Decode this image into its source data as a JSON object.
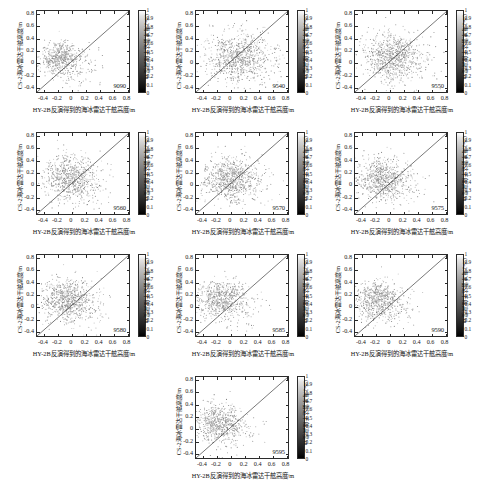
{
  "figure": {
    "axis_labels": {
      "xlabel": "HY-2B反演得到的海冰雷达干舷高度/m",
      "ylabel": "CS-2海冰雷达干舷高度/m",
      "colorbar_label": "CS-2海冰雷达干舷高度/m"
    },
    "xticks": [
      "-0.4",
      "-0.2",
      "0",
      "0.2",
      "0.4",
      "0.6",
      "0.8"
    ],
    "yticks": [
      "0.8",
      "0.6",
      "0.4",
      "0.2",
      "0",
      "-0.2",
      "-0.4"
    ],
    "colorbar_ticks": [
      "1",
      "0.9",
      "0.8",
      "0.7",
      "0.6",
      "0.5",
      "0.4",
      "0.3",
      "0.2",
      "0.1",
      "0"
    ],
    "colormap": "grayscale",
    "marker_color": "#9a9a9a",
    "line_color": "#1a1a1a"
  },
  "chart_data": [
    {
      "type": "scatter",
      "title": "9090",
      "xlabel": "HY-2B反演得到的海冰雷达干舷高度/m",
      "ylabel": "CS-2海冰雷达干舷高度/m",
      "xlim": [
        -0.5,
        0.85
      ],
      "ylim": [
        -0.5,
        0.85
      ],
      "xticks": [
        -0.4,
        -0.2,
        0,
        0.2,
        0.4,
        0.6,
        0.8
      ],
      "yticks": [
        -0.4,
        -0.2,
        0,
        0.2,
        0.4,
        0.6,
        0.8
      ],
      "grid": false,
      "reference_line": {
        "type": "1:1",
        "from": [
          -0.5,
          -0.5
        ],
        "to": [
          0.85,
          0.85
        ]
      },
      "n_points": 620,
      "cloud": {
        "cx": -0.16,
        "cy": 0.07,
        "sx": 0.15,
        "sy": 0.13,
        "rot": 0.25,
        "seed": 11
      },
      "colorbar": {
        "label": "CS-2海冰雷达干舷高度/m",
        "min": 0,
        "max": 1,
        "ticks": [
          0,
          0.1,
          0.2,
          0.3,
          0.4,
          0.5,
          0.6,
          0.7,
          0.8,
          0.9,
          1
        ]
      }
    },
    {
      "type": "scatter",
      "title": "9540",
      "xlabel": "HY-2B反演得到的海冰雷达干舷高度/m",
      "ylabel": "CS-2海冰雷达干舷高度/m",
      "xlim": [
        -0.5,
        0.85
      ],
      "ylim": [
        -0.5,
        0.85
      ],
      "xticks": [
        -0.4,
        -0.2,
        0,
        0.2,
        0.4,
        0.6,
        0.8
      ],
      "yticks": [
        -0.4,
        -0.2,
        0,
        0.2,
        0.4,
        0.6,
        0.8
      ],
      "grid": false,
      "reference_line": {
        "type": "1:1",
        "from": [
          -0.5,
          -0.5
        ],
        "to": [
          0.85,
          0.85
        ]
      },
      "n_points": 900,
      "cloud": {
        "cx": 0.1,
        "cy": 0.09,
        "sx": 0.23,
        "sy": 0.2,
        "rot": 0.2,
        "seed": 23
      },
      "colorbar": {
        "label": "CS-2海冰雷达干舷高度/m",
        "min": 0,
        "max": 1,
        "ticks": [
          0,
          0.1,
          0.2,
          0.3,
          0.4,
          0.5,
          0.6,
          0.7,
          0.8,
          0.9,
          1
        ]
      }
    },
    {
      "type": "scatter",
      "title": "9550",
      "xlabel": "HY-2B反演得到的海冰雷达干舷高度/m",
      "ylabel": "CS-2海冰雷达干舷高度/m",
      "xlim": [
        -0.5,
        0.85
      ],
      "ylim": [
        -0.5,
        0.85
      ],
      "xticks": [
        -0.4,
        -0.2,
        0,
        0.2,
        0.4,
        0.6,
        0.8
      ],
      "yticks": [
        -0.4,
        -0.2,
        0,
        0.2,
        0.4,
        0.6,
        0.8
      ],
      "grid": false,
      "reference_line": {
        "type": "1:1",
        "from": [
          -0.5,
          -0.5
        ],
        "to": [
          0.85,
          0.85
        ]
      },
      "n_points": 880,
      "cloud": {
        "cx": 0.04,
        "cy": 0.1,
        "sx": 0.21,
        "sy": 0.19,
        "rot": 0.22,
        "seed": 37
      },
      "colorbar": {
        "label": "CS-2海冰雷达干舷高度/m",
        "min": 0,
        "max": 1,
        "ticks": [
          0,
          0.1,
          0.2,
          0.3,
          0.4,
          0.5,
          0.6,
          0.7,
          0.8,
          0.9,
          1
        ]
      }
    },
    {
      "type": "scatter",
      "title": "9560",
      "xlabel": "HY-2B反演得到的海冰雷达干舷高度/m",
      "ylabel": "CS-2海冰雷达干舷高度/m",
      "xlim": [
        -0.5,
        0.85
      ],
      "ylim": [
        -0.5,
        0.85
      ],
      "xticks": [
        -0.4,
        -0.2,
        0,
        0.2,
        0.4,
        0.6,
        0.8
      ],
      "yticks": [
        -0.4,
        -0.2,
        0,
        0.2,
        0.4,
        0.6,
        0.8
      ],
      "grid": false,
      "reference_line": {
        "type": "1:1",
        "from": [
          -0.5,
          -0.5
        ],
        "to": [
          0.85,
          0.85
        ]
      },
      "n_points": 780,
      "cloud": {
        "cx": -0.04,
        "cy": 0.11,
        "sx": 0.19,
        "sy": 0.17,
        "rot": 0.2,
        "seed": 51
      },
      "colorbar": {
        "label": "CS-2海冰雷达干舷高度/m",
        "min": 0,
        "max": 1,
        "ticks": [
          0,
          0.1,
          0.2,
          0.3,
          0.4,
          0.5,
          0.6,
          0.7,
          0.8,
          0.9,
          1
        ]
      }
    },
    {
      "type": "scatter",
      "title": "9570",
      "xlabel": "HY-2B反演得到的海冰雷达干舷高度/m",
      "ylabel": "CS-2海冰雷达干舷高度/m",
      "xlim": [
        -0.5,
        0.85
      ],
      "ylim": [
        -0.5,
        0.85
      ],
      "xticks": [
        -0.4,
        -0.2,
        0,
        0.2,
        0.4,
        0.6,
        0.8
      ],
      "yticks": [
        -0.4,
        -0.2,
        0,
        0.2,
        0.4,
        0.6,
        0.8
      ],
      "grid": false,
      "reference_line": {
        "type": "1:1",
        "from": [
          -0.5,
          -0.5
        ],
        "to": [
          0.85,
          0.85
        ]
      },
      "n_points": 840,
      "cloud": {
        "cx": 0.0,
        "cy": 0.1,
        "sx": 0.2,
        "sy": 0.17,
        "rot": 0.18,
        "seed": 67
      },
      "colorbar": {
        "label": "CS-2海冰雷达干舷高度/m",
        "min": 0,
        "max": 1,
        "ticks": [
          0,
          0.1,
          0.2,
          0.3,
          0.4,
          0.5,
          0.6,
          0.7,
          0.8,
          0.9,
          1
        ]
      }
    },
    {
      "type": "scatter",
      "title": "9575",
      "xlabel": "HY-2B反演得到的海冰雷达干舷高度/m",
      "ylabel": "CS-2海冰雷达干舷高度/m",
      "xlim": [
        -0.5,
        0.85
      ],
      "ylim": [
        -0.5,
        0.85
      ],
      "xticks": [
        -0.4,
        -0.2,
        0,
        0.2,
        0.4,
        0.6,
        0.8
      ],
      "yticks": [
        -0.4,
        -0.2,
        0,
        0.2,
        0.4,
        0.6,
        0.8
      ],
      "grid": false,
      "reference_line": {
        "type": "1:1",
        "from": [
          -0.5,
          -0.5
        ],
        "to": [
          0.85,
          0.85
        ]
      },
      "n_points": 760,
      "cloud": {
        "cx": -0.1,
        "cy": 0.1,
        "sx": 0.18,
        "sy": 0.17,
        "rot": 0.15,
        "seed": 83
      },
      "colorbar": {
        "label": "CS-2海冰雷达干舷高度/m",
        "min": 0,
        "max": 1,
        "ticks": [
          0,
          0.1,
          0.2,
          0.3,
          0.4,
          0.5,
          0.6,
          0.7,
          0.8,
          0.9,
          1
        ]
      }
    },
    {
      "type": "scatter",
      "title": "9580",
      "xlabel": "HY-2B反演得到的海冰雷达干舷高度/m",
      "ylabel": "CS-2海冰雷达干舷高度/m",
      "xlim": [
        -0.5,
        0.85
      ],
      "ylim": [
        -0.5,
        0.85
      ],
      "xticks": [
        -0.4,
        -0.2,
        0,
        0.2,
        0.4,
        0.6,
        0.8
      ],
      "yticks": [
        -0.4,
        -0.2,
        0,
        0.2,
        0.4,
        0.6,
        0.8
      ],
      "grid": false,
      "reference_line": {
        "type": "1:1",
        "from": [
          -0.5,
          -0.5
        ],
        "to": [
          0.85,
          0.85
        ]
      },
      "n_points": 800,
      "cloud": {
        "cx": -0.08,
        "cy": 0.12,
        "sx": 0.19,
        "sy": 0.16,
        "rot": 0.17,
        "seed": 97
      },
      "colorbar": {
        "label": "CS-2海冰雷达干舷高度/m",
        "min": 0,
        "max": 1,
        "ticks": [
          0,
          0.1,
          0.2,
          0.3,
          0.4,
          0.5,
          0.6,
          0.7,
          0.8,
          0.9,
          1
        ]
      }
    },
    {
      "type": "scatter",
      "title": "9585",
      "xlabel": "HY-2B反演得到的海冰雷达干舷高度/m",
      "ylabel": "CS-2海冰雷达干舷高度/m",
      "xlim": [
        -0.5,
        0.85
      ],
      "ylim": [
        -0.5,
        0.85
      ],
      "xticks": [
        -0.4,
        -0.2,
        0,
        0.2,
        0.4,
        0.6,
        0.8
      ],
      "yticks": [
        -0.4,
        -0.2,
        0,
        0.2,
        0.4,
        0.6,
        0.8
      ],
      "grid": false,
      "reference_line": {
        "type": "1:1",
        "from": [
          -0.5,
          -0.5
        ],
        "to": [
          0.85,
          0.85
        ]
      },
      "n_points": 720,
      "cloud": {
        "cx": -0.14,
        "cy": 0.12,
        "sx": 0.17,
        "sy": 0.15,
        "rot": 0.16,
        "seed": 113
      },
      "colorbar": {
        "label": "CS-2海冰雷达干舷高度/m",
        "min": 0,
        "max": 1,
        "ticks": [
          0,
          0.1,
          0.2,
          0.3,
          0.4,
          0.5,
          0.6,
          0.7,
          0.8,
          0.9,
          1
        ]
      }
    },
    {
      "type": "scatter",
      "title": "9590",
      "xlabel": "HY-2B反演得到的海冰雷达干舷高度/m",
      "ylabel": "CS-2海冰雷达干舷高度/m",
      "xlim": [
        -0.5,
        0.85
      ],
      "ylim": [
        -0.5,
        0.85
      ],
      "xticks": [
        -0.4,
        -0.2,
        0,
        0.2,
        0.4,
        0.6,
        0.8
      ],
      "yticks": [
        -0.4,
        -0.2,
        0,
        0.2,
        0.4,
        0.6,
        0.8
      ],
      "grid": false,
      "reference_line": {
        "type": "1:1",
        "from": [
          -0.5,
          -0.5
        ],
        "to": [
          0.85,
          0.85
        ]
      },
      "n_points": 700,
      "cloud": {
        "cx": -0.17,
        "cy": 0.1,
        "sx": 0.16,
        "sy": 0.15,
        "rot": 0.14,
        "seed": 131
      },
      "colorbar": {
        "label": "CS-2海冰雷达干舷高度/m",
        "min": 0,
        "max": 1,
        "ticks": [
          0,
          0.1,
          0.2,
          0.3,
          0.4,
          0.5,
          0.6,
          0.7,
          0.8,
          0.9,
          1
        ]
      }
    },
    {
      "type": "scatter",
      "title": "9595",
      "xlabel": "HY-2B反演得到的海冰雷达干舷高度/m",
      "ylabel": "CS-2海冰雷达干舷高度/m",
      "xlim": [
        -0.5,
        0.85
      ],
      "ylim": [
        -0.5,
        0.85
      ],
      "xticks": [
        -0.4,
        -0.2,
        0,
        0.2,
        0.4,
        0.6,
        0.8
      ],
      "yticks": [
        -0.4,
        -0.2,
        0,
        0.2,
        0.4,
        0.6,
        0.8
      ],
      "grid": false,
      "reference_line": {
        "type": "1:1",
        "from": [
          -0.5,
          -0.5
        ],
        "to": [
          0.85,
          0.85
        ]
      },
      "n_points": 660,
      "cloud": {
        "cx": -0.16,
        "cy": 0.08,
        "sx": 0.16,
        "sy": 0.15,
        "rot": 0.13,
        "seed": 149
      },
      "colorbar": {
        "label": "CS-2海冰雷达干舷高度/m",
        "min": 0,
        "max": 1,
        "ticks": [
          0,
          0.1,
          0.2,
          0.3,
          0.4,
          0.5,
          0.6,
          0.7,
          0.8,
          0.9,
          1
        ]
      }
    }
  ]
}
